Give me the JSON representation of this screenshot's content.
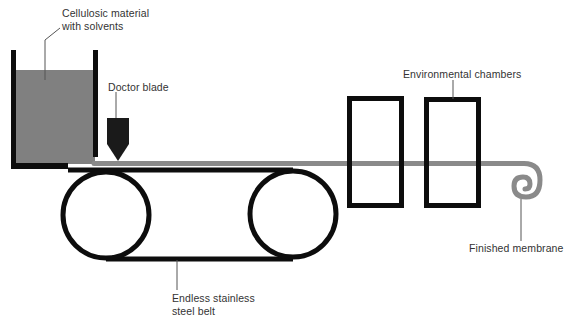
{
  "diagram": {
    "labels": {
      "tank": [
        "Cellulosic material",
        "with solvents"
      ],
      "doctor_blade": "Doctor blade",
      "chambers": "Environmental chambers",
      "belt": [
        "Endless stainless",
        "steel belt"
      ],
      "membrane": "Finished membrane"
    },
    "colors": {
      "outline": "#0d0d0d",
      "solution": "#808080",
      "membrane": "#8a8a8a",
      "leader": "#555555",
      "text": "#333333"
    }
  }
}
